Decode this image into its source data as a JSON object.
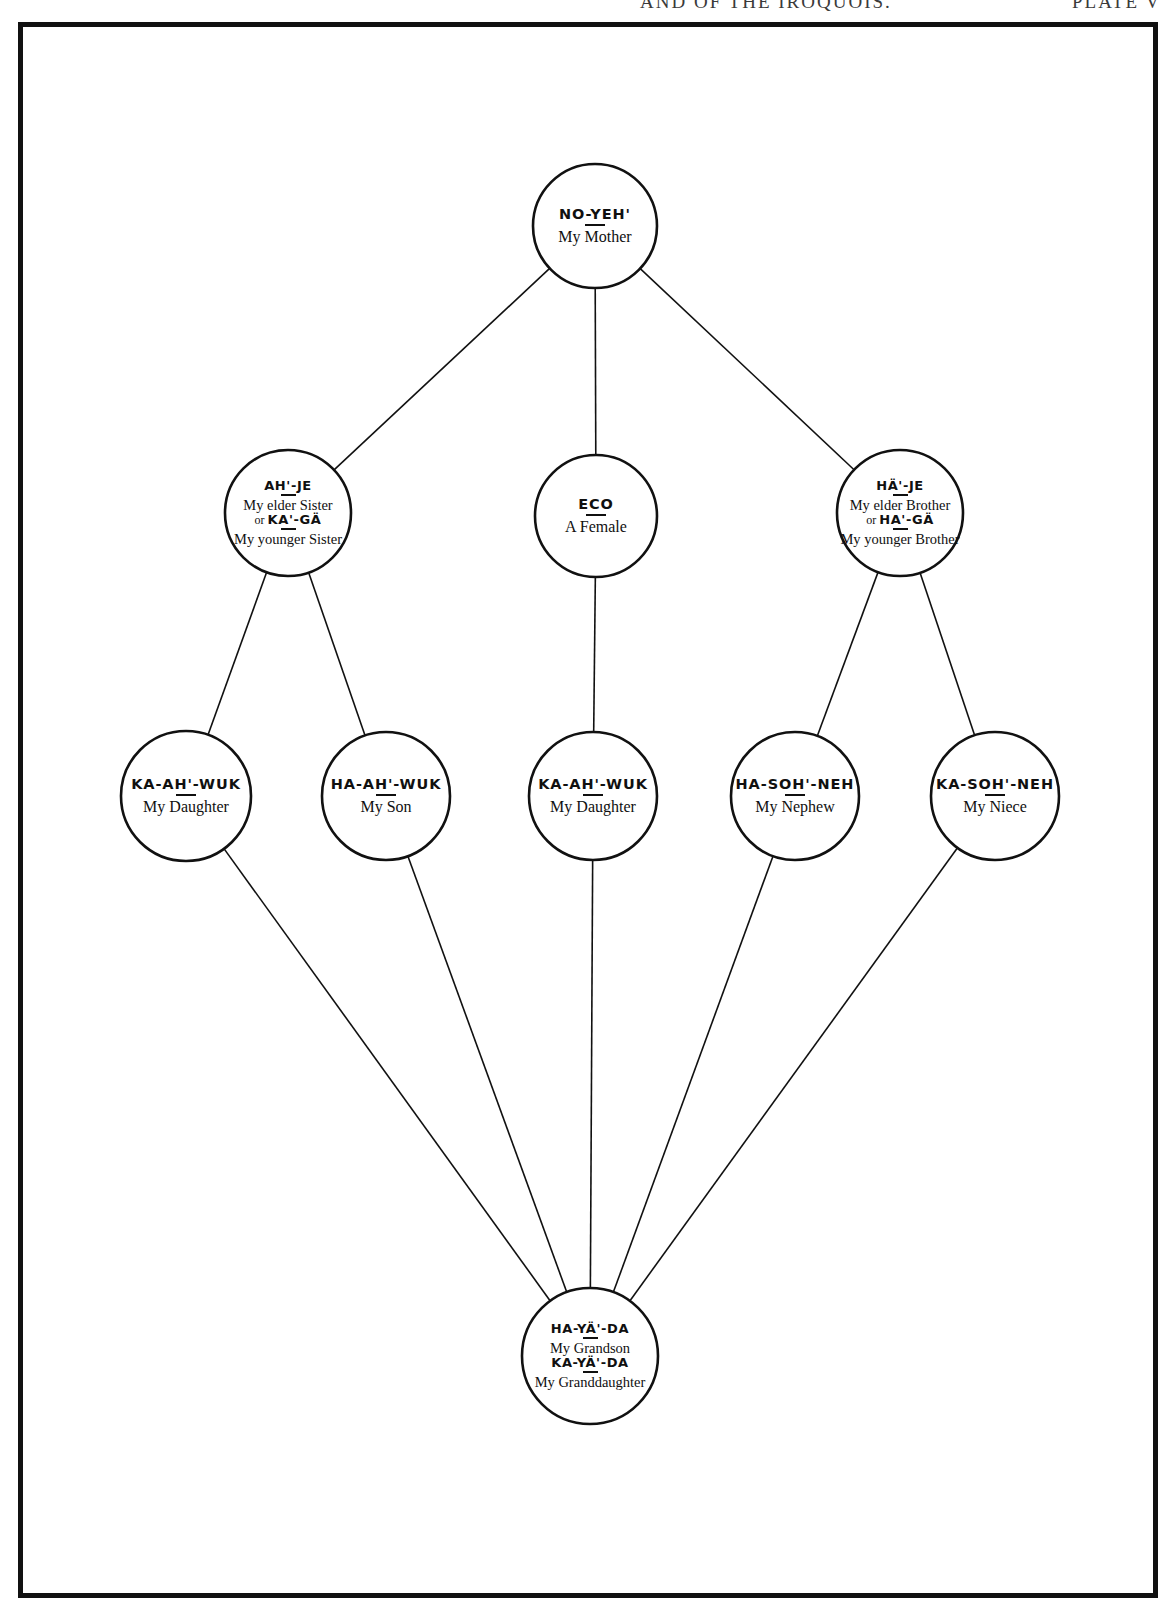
{
  "page": {
    "running_head": "AND OF THE IROQUOIS.",
    "plate_number": "PLATE V"
  },
  "diagram": {
    "type": "kinship-chart",
    "nodes": [
      {
        "id": "mother",
        "native": "NO-YEH'",
        "gloss": "My Mother",
        "cx": 595,
        "cy": 226,
        "r": 62,
        "row": 1
      },
      {
        "id": "sister",
        "native": "AH'-JE",
        "gloss": "My elder Sister",
        "native_alt": "KA'-GÄ",
        "gloss_alt": "My younger Sister",
        "alt_prefix": "or",
        "cx": 288,
        "cy": 513,
        "r": 63,
        "row": 2
      },
      {
        "id": "ego",
        "native": "ECO",
        "gloss": "A Female",
        "cx": 596,
        "cy": 516,
        "r": 61,
        "row": 2
      },
      {
        "id": "brother",
        "native": "HÄ'-JE",
        "gloss": "My elder Brother",
        "native_alt": "HA'-GÄ",
        "gloss_alt": "My younger Brother",
        "alt_prefix": "or",
        "cx": 900,
        "cy": 513,
        "r": 63,
        "row": 2
      },
      {
        "id": "daughter-left",
        "native": "KA-AH'-WUK",
        "gloss": "My Daughter",
        "cx": 186,
        "cy": 796,
        "r": 65,
        "row": 3
      },
      {
        "id": "son-left",
        "native": "HA-AH'-WUK",
        "gloss": "My Son",
        "cx": 386,
        "cy": 796,
        "r": 64,
        "row": 3
      },
      {
        "id": "daughter-center",
        "native": "KA-AH'-WUK",
        "gloss": "My Daughter",
        "cx": 593,
        "cy": 796,
        "r": 64,
        "row": 3
      },
      {
        "id": "nephew",
        "native": "HA-SOH'-NEH",
        "gloss": "My Nephew",
        "cx": 795,
        "cy": 796,
        "r": 64,
        "row": 3
      },
      {
        "id": "niece",
        "native": "KA-SOH'-NEH",
        "gloss": "My Niece",
        "cx": 995,
        "cy": 796,
        "r": 64,
        "row": 3
      },
      {
        "id": "grandchild",
        "native": "HA-YÄ'-DA",
        "gloss": "My Grandson",
        "native_alt": "KA-YÄ'-DA",
        "gloss_alt": "My Granddaughter",
        "cx": 590,
        "cy": 1356,
        "r": 68,
        "row": 4
      }
    ],
    "edges": [
      {
        "from": "mother",
        "to": "sister"
      },
      {
        "from": "mother",
        "to": "ego"
      },
      {
        "from": "mother",
        "to": "brother"
      },
      {
        "from": "sister",
        "to": "daughter-left"
      },
      {
        "from": "sister",
        "to": "son-left"
      },
      {
        "from": "ego",
        "to": "daughter-center"
      },
      {
        "from": "brother",
        "to": "nephew"
      },
      {
        "from": "brother",
        "to": "niece"
      },
      {
        "from": "daughter-left",
        "to": "grandchild"
      },
      {
        "from": "son-left",
        "to": "grandchild"
      },
      {
        "from": "daughter-center",
        "to": "grandchild"
      },
      {
        "from": "nephew",
        "to": "grandchild"
      },
      {
        "from": "niece",
        "to": "grandchild"
      }
    ],
    "style": {
      "line_color": "#111111",
      "circle_stroke": "#111111",
      "background": "#ffffff"
    }
  }
}
